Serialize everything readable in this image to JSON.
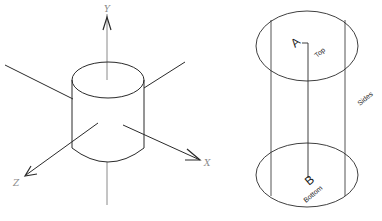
{
  "figure": {
    "left_panel": {
      "title": "Cylinder with coordinate axes",
      "axes": {
        "y_label": "Y",
        "x_label": "X",
        "z_label": "Z"
      }
    },
    "right_panel": {
      "title": "Cylinder surfaces",
      "labels": {
        "point_a": "A",
        "top": "Top",
        "point_b": "B",
        "bottom": "Bottom",
        "sides": "Sides"
      }
    },
    "colors": {
      "line": "#2a2a2a",
      "axis_gray": "#8a8a8a",
      "background": "#ffffff"
    }
  }
}
